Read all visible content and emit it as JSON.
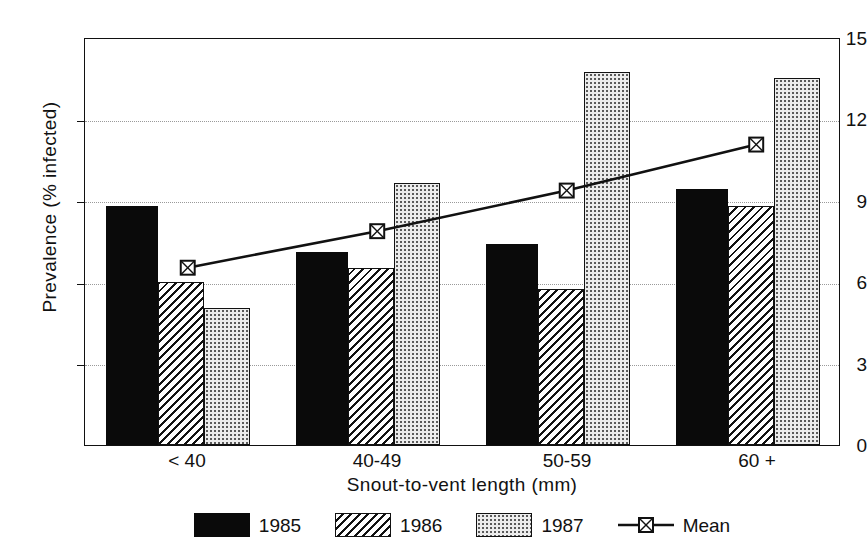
{
  "chart_data": {
    "type": "bar",
    "title": "",
    "xlabel": "Snout-to-vent length (mm)",
    "ylabel": "Prevalence (% infected)",
    "categories": [
      "< 40",
      "40-49",
      "50-59",
      "60 +"
    ],
    "ylim": [
      0,
      15
    ],
    "yticks": [
      0,
      3,
      6,
      9,
      12,
      15
    ],
    "ytick_labels": [
      "0",
      "3",
      "6",
      "9",
      "12",
      "15"
    ],
    "grid": true,
    "grid_axis": "y",
    "legend_position": "bottom",
    "series": [
      {
        "name": "1985",
        "type": "bar",
        "fill": "solid-black",
        "values": [
          8.8,
          7.1,
          7.4,
          9.4
        ]
      },
      {
        "name": "1986",
        "type": "bar",
        "fill": "diagonal-hatch",
        "values": [
          6.0,
          6.5,
          5.75,
          8.8
        ]
      },
      {
        "name": "1987",
        "type": "bar",
        "fill": "light-dotted",
        "values": [
          5.05,
          9.65,
          13.7,
          13.5
        ]
      },
      {
        "name": "Mean",
        "type": "line",
        "marker": "square",
        "values": [
          6.55,
          7.9,
          9.4,
          11.1
        ]
      }
    ]
  },
  "axes": {
    "y_title": "Prevalence (% infected)",
    "x_title": "Snout-to-vent length (mm)",
    "y_tick_labels": [
      "15",
      "12",
      "9",
      "6",
      "3",
      "0"
    ],
    "x_tick_labels": [
      "< 40",
      "40-49",
      "50-59",
      "60 +"
    ]
  },
  "legend": {
    "items": [
      {
        "label": "1985",
        "swatch": "solid-black-swatch"
      },
      {
        "label": "1986",
        "swatch": "hatched-swatch"
      },
      {
        "label": "1987",
        "swatch": "dotted-swatch"
      },
      {
        "label": "Mean",
        "swatch": "line-marker-swatch"
      }
    ]
  },
  "colors": {
    "y1985": "#0a0a0a",
    "y1986": "#111111",
    "y1987": "#ececec",
    "mean_line": "#111111",
    "grid": "#9a9a9a",
    "frame": "#111111",
    "background": "#ffffff"
  }
}
